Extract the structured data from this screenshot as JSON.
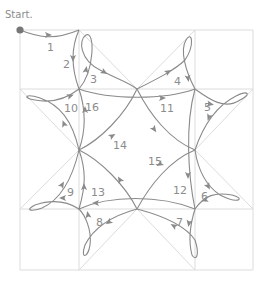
{
  "diagram": {
    "start_label": "Start.",
    "colors": {
      "grid": "#dcdcdc",
      "path": "#8a8a8a",
      "label": "#8c8c8c",
      "start_dot": "#777777"
    },
    "grid": {
      "xs": [
        20,
        79,
        137,
        195,
        253
      ],
      "ys": [
        30,
        89,
        150,
        209,
        270
      ]
    },
    "segments": [
      {
        "n": "1",
        "label_pos": [
          47,
          47
        ],
        "d": "M20,30 C40,38 55,40 79,30"
      },
      {
        "n": "2",
        "label_pos": [
          63,
          64
        ],
        "d": "M79,30 C70,50 72,70 79,89"
      },
      {
        "n": "3",
        "label_pos": [
          90,
          79
        ],
        "d": "M79,89 C95,70 95,30 86,35 C78,40 80,60 100,70 C115,78 128,82 137,89"
      },
      {
        "n": "4",
        "label_pos": [
          174,
          81
        ],
        "d": "M137,89 C155,80 175,70 185,60 C195,45 192,30 186,40 C180,50 185,70 195,89"
      },
      {
        "n": "5",
        "label_pos": [
          204,
          107
        ],
        "d": "M195,89 C210,100 225,110 240,100 C252,94 248,90 236,96 C220,104 205,120 195,150"
      },
      {
        "n": "6",
        "label_pos": [
          201,
          196
        ],
        "d": "M195,150 C198,170 205,185 220,195 C240,205 245,198 232,195 C215,192 205,195 195,209"
      },
      {
        "n": "7",
        "label_pos": [
          176,
          222
        ],
        "d": "M195,209 C190,225 188,240 192,255 C196,262 200,255 195,240 C185,225 160,215 137,209"
      },
      {
        "n": "8",
        "label_pos": [
          96,
          222
        ],
        "d": "M137,209 C115,215 95,225 85,245 C80,260 88,258 90,245 C92,230 85,215 79,209"
      },
      {
        "n": "9",
        "label_pos": [
          67,
          192
        ],
        "d": "M79,209 C65,200 50,200 35,205 C25,210 30,212 42,208 C60,200 72,180 79,150"
      },
      {
        "n": "10",
        "label_pos": [
          64,
          108
        ],
        "d": "M79,150 C72,120 60,105 40,98 C25,93 22,98 35,100 C55,104 70,96 79,89"
      },
      {
        "n": "11",
        "label_pos": [
          160,
          108
        ],
        "d": "M79,89 C110,100 165,100 195,89"
      },
      {
        "n": "12",
        "label_pos": [
          173,
          190
        ],
        "d": "M195,89 C185,125 188,175 195,209"
      },
      {
        "n": "13",
        "label_pos": [
          91,
          192
        ],
        "d": "M195,209 C160,195 110,195 79,209 C86,185 86,170 79,150"
      },
      {
        "n": "14",
        "label_pos": [
          113,
          145
        ],
        "d": "M79,150 C100,140 125,115 137,89 C150,115 170,140 195,150"
      },
      {
        "n": "15",
        "label_pos": [
          148,
          161
        ],
        "d": "M195,150 C170,160 150,185 137,209 C125,185 100,160 79,150"
      },
      {
        "n": "16",
        "label_pos": [
          85,
          107
        ],
        "d": "M79,150 C86,130 86,110 79,89"
      }
    ],
    "arrows": [
      {
        "x": 48,
        "y": 35,
        "angle": 0
      },
      {
        "x": 73,
        "y": 58,
        "angle": 90
      },
      {
        "x": 86,
        "y": 70,
        "angle": -80
      },
      {
        "x": 104,
        "y": 72,
        "angle": 30
      },
      {
        "x": 168,
        "y": 72,
        "angle": -30
      },
      {
        "x": 188,
        "y": 78,
        "angle": 80
      },
      {
        "x": 210,
        "y": 104,
        "angle": 10
      },
      {
        "x": 209,
        "y": 117,
        "angle": 110
      },
      {
        "x": 208,
        "y": 186,
        "angle": 60
      },
      {
        "x": 205,
        "y": 200,
        "angle": 160
      },
      {
        "x": 189,
        "y": 223,
        "angle": 100
      },
      {
        "x": 174,
        "y": 226,
        "angle": 210
      },
      {
        "x": 109,
        "y": 222,
        "angle": 145
      },
      {
        "x": 88,
        "y": 215,
        "angle": -100
      },
      {
        "x": 63,
        "y": 198,
        "angle": 180
      },
      {
        "x": 62,
        "y": 185,
        "angle": -60
      },
      {
        "x": 64,
        "y": 124,
        "angle": -110
      },
      {
        "x": 70,
        "y": 96,
        "angle": -20
      },
      {
        "x": 162,
        "y": 98,
        "angle": 0
      },
      {
        "x": 188,
        "y": 175,
        "angle": 90
      },
      {
        "x": 96,
        "y": 203,
        "angle": 180
      },
      {
        "x": 84,
        "y": 187,
        "angle": -90
      },
      {
        "x": 112,
        "y": 136,
        "angle": -30
      },
      {
        "x": 154,
        "y": 129,
        "angle": 55
      },
      {
        "x": 160,
        "y": 164,
        "angle": 150
      },
      {
        "x": 120,
        "y": 180,
        "angle": -120
      },
      {
        "x": 85,
        "y": 110,
        "angle": -90
      }
    ]
  }
}
